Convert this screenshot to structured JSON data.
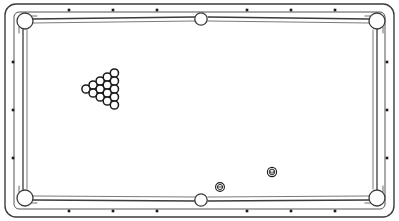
{
  "diagram": {
    "caption": "Top view line drawing of a pool table with racked balls and two loose balls",
    "style": "line-art"
  },
  "colors": {
    "background": "#ffffff",
    "outline": "#3b3b3b",
    "outline_light": "#6b6b6b",
    "rail_line": "#444444",
    "ball_outline": "#1a1a1a",
    "ball_fill": "#ffffff",
    "sight_dot": "#1a1a1a",
    "pocket_fill": "#ffffff"
  },
  "canvas": {
    "width": 399,
    "height": 221
  },
  "table": {
    "outer_frame": {
      "x": 5,
      "y": 4,
      "width": 389,
      "height": 213,
      "corner_radius": 11,
      "stroke_width": 1.4
    },
    "rail_band": {
      "x": 14,
      "y": 12,
      "width": 371,
      "height": 197,
      "corner_radius": 5,
      "stroke_width": 1.1
    },
    "cushion_line": {
      "x": 23,
      "y": 20,
      "width": 353,
      "height": 181,
      "stroke_width": 1.2
    },
    "playfield": {
      "x": 27,
      "y": 24,
      "width": 345,
      "height": 173
    }
  },
  "pockets": [
    {
      "name": "top-left-corner",
      "cx": 25,
      "cy": 21,
      "r": 8.0,
      "type": "corner"
    },
    {
      "name": "top-side",
      "cx": 201,
      "cy": 19,
      "r": 6.2,
      "type": "side"
    },
    {
      "name": "top-right-corner",
      "cx": 377,
      "cy": 21,
      "r": 8.0,
      "type": "corner"
    },
    {
      "name": "bottom-left-corner",
      "cx": 25,
      "cy": 198,
      "r": 8.0,
      "type": "corner"
    },
    {
      "name": "bottom-side",
      "cx": 201,
      "cy": 200,
      "r": 6.2,
      "type": "side"
    },
    {
      "name": "bottom-right-corner",
      "cx": 377,
      "cy": 198,
      "r": 8.0,
      "type": "corner"
    }
  ],
  "sight_dots": {
    "size": 2.6,
    "top": [
      {
        "cx": 69,
        "cy": 10
      },
      {
        "cx": 113,
        "cy": 10
      },
      {
        "cx": 157,
        "cy": 10
      },
      {
        "cx": 247,
        "cy": 10
      },
      {
        "cx": 291,
        "cy": 10
      },
      {
        "cx": 335,
        "cy": 10
      }
    ],
    "bottom": [
      {
        "cx": 69,
        "cy": 211
      },
      {
        "cx": 113,
        "cy": 211
      },
      {
        "cx": 157,
        "cy": 211
      },
      {
        "cx": 247,
        "cy": 211
      },
      {
        "cx": 291,
        "cy": 211
      },
      {
        "cx": 335,
        "cy": 211
      }
    ],
    "left": [
      {
        "cx": 13,
        "cy": 62
      },
      {
        "cx": 13,
        "cy": 110
      },
      {
        "cx": 13,
        "cy": 158
      }
    ],
    "right": [
      {
        "cx": 387,
        "cy": 62
      },
      {
        "cx": 387,
        "cy": 110
      },
      {
        "cx": 387,
        "cy": 158
      }
    ]
  },
  "rack": {
    "label": "fifteen-ball-triangle-rack",
    "ball_count": 15,
    "ball_radius": 4.1,
    "apex_direction": "left",
    "apex_x": 86,
    "apex_y": 89,
    "row_step_x": 7.1,
    "ball_step_y": 8.0,
    "rows": [
      {
        "index": 1,
        "count": 1
      },
      {
        "index": 2,
        "count": 2
      },
      {
        "index": 3,
        "count": 3
      },
      {
        "index": 4,
        "count": 4
      },
      {
        "index": 5,
        "count": 5
      }
    ]
  },
  "loose_balls": [
    {
      "name": "object-ball-lower-left",
      "cx": 220,
      "cy": 187,
      "r": 4.4,
      "marking": "horizontal-band",
      "inner_r": 2.6
    },
    {
      "name": "object-ball-lower-right",
      "cx": 272,
      "cy": 172,
      "r": 4.6,
      "marking": "numbered-circle",
      "inner_r": 2.8
    }
  ]
}
